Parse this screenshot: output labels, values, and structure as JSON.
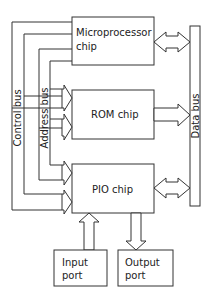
{
  "diagram": {
    "type": "block-diagram",
    "blocks": {
      "microprocessor": {
        "line1": "Microprocessor",
        "line2": "chip"
      },
      "rom": {
        "label": "ROM chip"
      },
      "pio": {
        "label": "PIO chip"
      },
      "input_port": {
        "line1": "Input",
        "line2": "port"
      },
      "output_port": {
        "line1": "Output",
        "line2": "port"
      },
      "data_bus": {
        "label": "Data bus"
      }
    },
    "buses": {
      "control": {
        "label": "Control bus"
      },
      "address": {
        "label": "Address bus"
      }
    },
    "connections": [
      {
        "from": "Microprocessor chip",
        "to": "Data bus",
        "direction": "bidirectional"
      },
      {
        "from": "ROM chip",
        "to": "Data bus",
        "direction": "unidirectional"
      },
      {
        "from": "PIO chip",
        "to": "Data bus",
        "direction": "bidirectional"
      },
      {
        "from": "Input port",
        "to": "PIO chip",
        "direction": "unidirectional"
      },
      {
        "from": "PIO chip",
        "to": "Output port",
        "direction": "unidirectional"
      },
      {
        "from": "Control bus",
        "to": "ROM chip",
        "direction": "unidirectional"
      },
      {
        "from": "Address bus",
        "to": "ROM chip",
        "direction": "unidirectional"
      },
      {
        "from": "Control bus",
        "to": "PIO chip",
        "direction": "unidirectional"
      },
      {
        "from": "Address bus",
        "to": "PIO chip",
        "direction": "unidirectional"
      },
      {
        "from": "Microprocessor chip",
        "to": "Control bus",
        "direction": "unidirectional"
      },
      {
        "from": "Microprocessor chip",
        "to": "Address bus",
        "direction": "unidirectional"
      }
    ]
  }
}
